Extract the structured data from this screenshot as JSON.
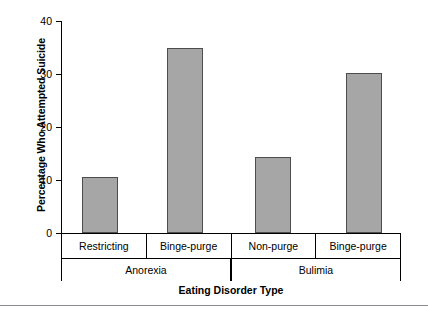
{
  "chart_data": {
    "type": "bar",
    "title": "",
    "xlabel": "Eating Disorder Type",
    "ylabel": "Percentage Who Attempted Suicide",
    "ylim": [
      0,
      40
    ],
    "yticks": [
      0,
      10,
      20,
      30,
      40
    ],
    "ytick_labels": [
      "0",
      "10",
      "20",
      "30",
      "40"
    ],
    "grid": false,
    "legend": false,
    "bar_color": "#a6a6a6",
    "bar_edge_color": "#4d4d4d",
    "categories": [
      "Restricting",
      "Binge-purge",
      "Non-purge",
      "Binge-purge"
    ],
    "values": [
      10.5,
      35.0,
      14.4,
      30.2
    ],
    "groups": [
      {
        "label": "Anorexia",
        "categories": [
          "Restricting",
          "Binge-purge"
        ],
        "values": [
          10.5,
          35.0
        ]
      },
      {
        "label": "Bulimia",
        "categories": [
          "Non-purge",
          "Binge-purge"
        ],
        "values": [
          14.4,
          30.2
        ]
      }
    ],
    "bars": [
      {
        "category": "Restricting",
        "group": "Anorexia",
        "value": 10.5
      },
      {
        "category": "Binge-purge",
        "group": "Anorexia",
        "value": 35.0
      },
      {
        "category": "Non-purge",
        "group": "Bulimia",
        "value": 14.4
      },
      {
        "category": "Binge-purge",
        "group": "Bulimia",
        "value": 30.2
      }
    ]
  }
}
